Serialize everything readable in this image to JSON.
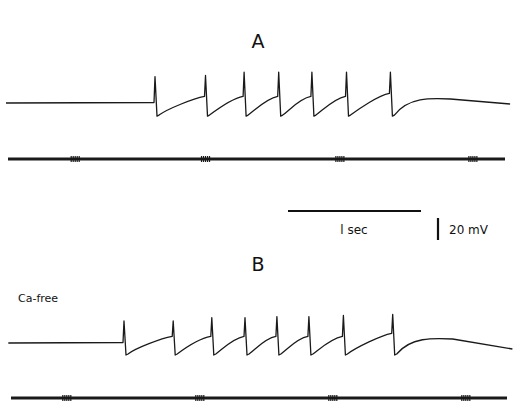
{
  "chart_data": [
    {
      "type": "line",
      "panel": "A",
      "title": "A",
      "condition": "",
      "description": "Membrane potential trace showing a train of 7 action potentials during stimulation",
      "resting_potential_relative_mV": 0,
      "spikes": [
        {
          "time_s": 0.0,
          "peak_mV": 24,
          "trough_mV": -11
        },
        {
          "time_s": 0.38,
          "peak_mV": 25,
          "trough_mV": -11
        },
        {
          "time_s": 0.67,
          "peak_mV": 28,
          "trough_mV": -11
        },
        {
          "time_s": 0.93,
          "peak_mV": 28,
          "trough_mV": -11
        },
        {
          "time_s": 1.18,
          "peak_mV": 28,
          "trough_mV": -11
        },
        {
          "time_s": 1.44,
          "peak_mV": 28,
          "trough_mV": -11
        },
        {
          "time_s": 1.77,
          "peak_mV": 28,
          "trough_mV": -11
        }
      ],
      "stimulus_marker": {
        "tick_times_s": [
          -0.6,
          0.38,
          1.39,
          2.39
        ]
      },
      "time_range_s": [
        -1.12,
        2.67
      ]
    },
    {
      "type": "line",
      "panel": "B",
      "title": "B",
      "condition": "Ca-free",
      "description": "Membrane potential trace in Ca-free solution showing a train of 8 action potentials",
      "resting_potential_relative_mV": 0,
      "spikes": [
        {
          "time_s": 0.0,
          "peak_mV": 20,
          "trough_mV": -10
        },
        {
          "time_s": 0.37,
          "peak_mV": 20,
          "trough_mV": -10
        },
        {
          "time_s": 0.66,
          "peak_mV": 23,
          "trough_mV": -10
        },
        {
          "time_s": 0.91,
          "peak_mV": 23,
          "trough_mV": -10
        },
        {
          "time_s": 1.15,
          "peak_mV": 24,
          "trough_mV": -10
        },
        {
          "time_s": 1.39,
          "peak_mV": 24,
          "trough_mV": -10
        },
        {
          "time_s": 1.65,
          "peak_mV": 25,
          "trough_mV": -10
        },
        {
          "time_s": 2.02,
          "peak_mV": 26,
          "trough_mV": -10
        }
      ],
      "stimulus_marker": {
        "tick_times_s": [
          -0.43,
          0.57,
          1.57,
          2.57
        ]
      },
      "time_range_s": [
        -0.87,
        2.92
      ]
    }
  ],
  "scale_bars": {
    "time_label": "1 sec",
    "time_value_s": 1,
    "voltage_label": "20 mV",
    "voltage_value_mV": 20
  },
  "labels": {
    "panel_a": "A",
    "panel_b": "B",
    "condition_b": "Ca-free",
    "time_scale": "l sec",
    "voltage_scale": "20 mV"
  }
}
